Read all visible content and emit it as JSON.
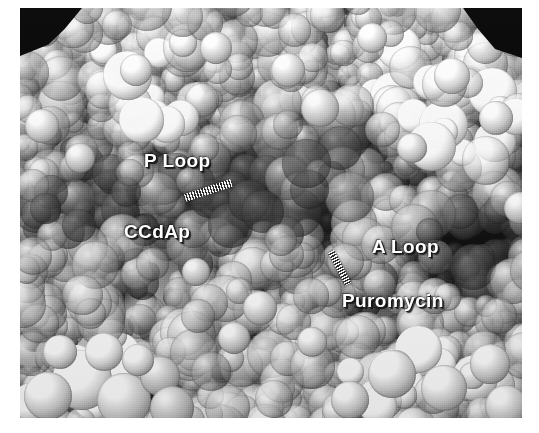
{
  "figure": {
    "kind": "space-filling-molecular-model",
    "background_color": "#ffffff",
    "surface_base_color": "#7c7c7c",
    "cavity_color": "#000000",
    "label_color": "#ffffff",
    "label_shadow_color": "#1a1a1a",
    "annotations": [
      {
        "id": "p-loop",
        "label": "P Loop",
        "x": 124,
        "y": 142
      },
      {
        "id": "ccdap",
        "label": "CCdAp",
        "x": 104,
        "y": 213
      },
      {
        "id": "a-loop",
        "label": "A Loop",
        "x": 352,
        "y": 228
      },
      {
        "id": "puromycin",
        "label": "Puromycin",
        "x": 322,
        "y": 282
      }
    ],
    "pointers": [
      {
        "id": "pointer-ccdap",
        "points_to": "CCdAp",
        "style": "hatched-bar",
        "angle_deg": -18,
        "length": 49
      },
      {
        "id": "pointer-puromycin",
        "points_to": "Puromycin",
        "style": "hatched-bar",
        "angle_deg": 62,
        "length": 37
      }
    ],
    "frame": {
      "left": 20,
      "top": 8,
      "width": 502,
      "height": 410
    }
  }
}
